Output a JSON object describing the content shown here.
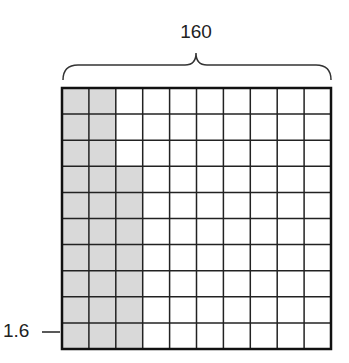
{
  "diagram": {
    "top_label": "160",
    "side_label": "1.6",
    "grid": {
      "rows": 10,
      "cols": 10,
      "shaded_per_row": [
        2,
        2,
        2,
        3,
        3,
        3,
        3,
        3,
        3,
        3
      ],
      "shaded_total": 27,
      "shade_color": "#d9d9d9",
      "line_color": "#222222"
    }
  }
}
